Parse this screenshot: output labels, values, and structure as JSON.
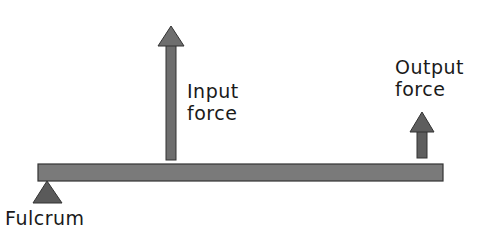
{
  "diagram": {
    "type": "lever",
    "labels": {
      "input": [
        "Input",
        "force"
      ],
      "output": [
        "Output",
        "force"
      ],
      "fulcrum": "Fulcrum"
    },
    "colors": {
      "beam": "#7a7a7a",
      "arrow": "#6e6e6e",
      "fulcrum": "#5a5a5a",
      "outline": "#333333",
      "text": "#1a1a1a"
    }
  }
}
